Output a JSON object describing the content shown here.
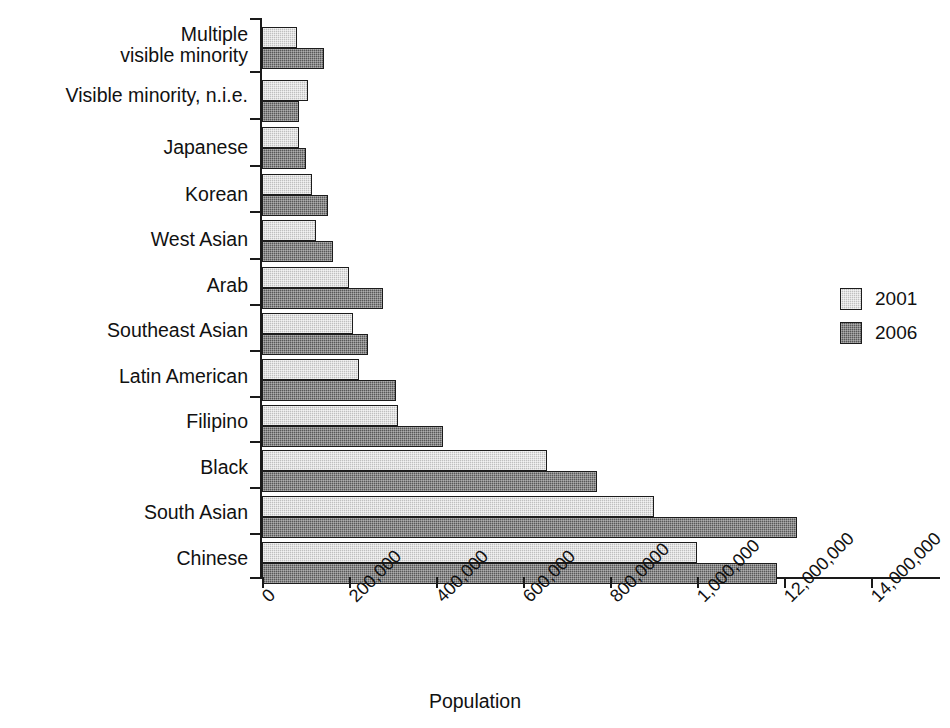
{
  "chart_data": {
    "type": "bar",
    "orientation": "horizontal",
    "title": "",
    "xlabel": "Population",
    "ylabel": "",
    "categories": [
      "Chinese",
      "South Asian",
      "Black",
      "Filipino",
      "Latin American",
      "Southeast Asian",
      "Arab",
      "West Asian",
      "Korean",
      "Japanese",
      "Visible minority, n.i.e.",
      "Multiple\nvisible minority"
    ],
    "series": [
      {
        "name": "2001",
        "color": "#bfbfbf",
        "values": [
          1000000,
          900000,
          655000,
          313000,
          224000,
          209000,
          199000,
          124000,
          115000,
          85000,
          106000,
          80000
        ]
      },
      {
        "name": "2006",
        "color": "#585858",
        "values": [
          1185000,
          1230000,
          770000,
          417000,
          308000,
          243000,
          279000,
          164000,
          152000,
          100000,
          84000,
          142000
        ]
      }
    ],
    "xlim": [
      0,
      1400000
    ],
    "xticks": [
      0,
      200000,
      400000,
      600000,
      800000,
      1000000,
      1200000,
      1400000
    ],
    "xtick_labels": [
      "0",
      "200,000",
      "400,000",
      "600,000",
      "800,0000",
      "1,000,000",
      "12,000,000",
      "14,000,000"
    ],
    "grid": false,
    "legend_position": "right"
  },
  "legend": {
    "entries": [
      {
        "label": "2001",
        "color": "#bfbfbf"
      },
      {
        "label": "2006",
        "color": "#585858"
      }
    ]
  },
  "axis": {
    "x_title": "Population"
  }
}
